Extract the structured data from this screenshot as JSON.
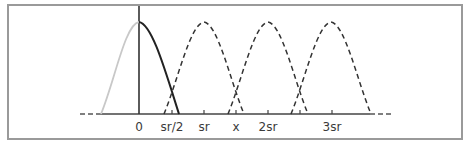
{
  "diagram": {
    "type": "shifted-pulse-kernel",
    "axis_labels": [
      {
        "id": "zero",
        "text": "0",
        "x": 139
      },
      {
        "id": "half-sr",
        "text": "sr/2",
        "x": 172
      },
      {
        "id": "sr",
        "text": "sr",
        "x": 204
      },
      {
        "id": "x",
        "text": "x",
        "x": 236
      },
      {
        "id": "two-sr",
        "text": "2sr",
        "x": 268
      },
      {
        "id": "three-sr",
        "text": "3sr",
        "x": 332
      }
    ],
    "curves": [
      {
        "id": "kernel-left-half",
        "style": "solid",
        "color": "#c8c8c8",
        "center": 139
      },
      {
        "id": "kernel-right-half",
        "style": "solid",
        "color": "#222222",
        "center": 139
      },
      {
        "id": "shifted-kernel-sr",
        "style": "dashed",
        "color": "#333333",
        "center": 204
      },
      {
        "id": "shifted-kernel-2sr",
        "style": "dashed",
        "color": "#333333",
        "center": 268
      },
      {
        "id": "shifted-kernel-3sr",
        "style": "dashed",
        "color": "#333333",
        "center": 331
      }
    ],
    "colors": {
      "frame": "#9a9a9a",
      "axis": "#333333",
      "kernel_left": "#c8c8c8",
      "kernel_right": "#222222",
      "dashed": "#333333"
    }
  }
}
